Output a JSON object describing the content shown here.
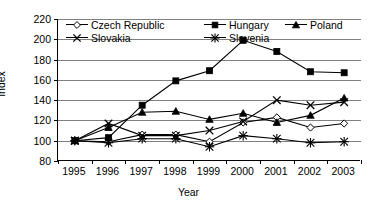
{
  "chart_data": {
    "type": "line",
    "title": "",
    "xlabel": "Year",
    "ylabel": "Index",
    "categories": [
      "1995",
      "1996",
      "1997",
      "1998",
      "1999",
      "2000",
      "2001",
      "2002",
      "2003"
    ],
    "x": [
      1995,
      1996,
      1997,
      1998,
      1999,
      2000,
      2001,
      2002,
      2003
    ],
    "ylim": [
      80,
      220
    ],
    "yticks": [
      80,
      100,
      120,
      140,
      160,
      180,
      200,
      220
    ],
    "grid": true,
    "legend_position": "top-inside",
    "series": [
      {
        "name": "Czech Republic",
        "marker": "diamond-open",
        "values": [
          100,
          99,
          106,
          106,
          99,
          118,
          123,
          113,
          117
        ]
      },
      {
        "name": "Hungary",
        "marker": "square-filled",
        "values": [
          100,
          103,
          135,
          159,
          169,
          199,
          188,
          168,
          167
        ]
      },
      {
        "name": "Poland",
        "marker": "triangle-filled",
        "values": [
          100,
          113,
          128,
          129,
          121,
          127,
          118,
          125,
          142
        ]
      },
      {
        "name": "Slovakia",
        "marker": "cross-x",
        "values": [
          100,
          117,
          105,
          105,
          110,
          119,
          140,
          135,
          138
        ]
      },
      {
        "name": "Slovenia",
        "marker": "asterisk",
        "values": [
          100,
          98,
          102,
          102,
          94,
          105,
          102,
          98,
          99
        ]
      }
    ]
  },
  "axis": {
    "y_title": "Index",
    "x_title": "Year",
    "y_tick_labels": [
      "220",
      "200",
      "180",
      "160",
      "140",
      "120",
      "100",
      "80"
    ],
    "x_tick_labels": [
      "1995",
      "1996",
      "1997",
      "1998",
      "1999",
      "2000",
      "2001",
      "2002",
      "2003"
    ]
  },
  "legend": {
    "row1": [
      "Czech Republic",
      "Hungary",
      "Poland"
    ],
    "row2": [
      "Slovakia",
      "Slovenia"
    ]
  },
  "colors": {
    "ink": "#000000",
    "grid": "#808080",
    "background": "#ffffff"
  }
}
